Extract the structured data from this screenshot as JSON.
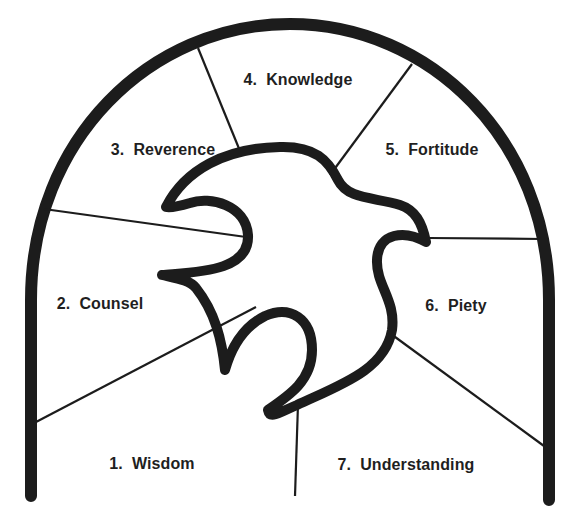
{
  "diagram": {
    "type": "arch-with-dove",
    "stroke_color": "#1c1c1c",
    "background": "#ffffff",
    "center_figure": "dove",
    "segments": [
      {
        "id": 1,
        "label": "1.  Wisdom",
        "x": 152,
        "y": 464
      },
      {
        "id": 2,
        "label": "2.  Counsel",
        "x": 100,
        "y": 304
      },
      {
        "id": 3,
        "label": "3.  Reverence",
        "x": 163,
        "y": 150
      },
      {
        "id": 4,
        "label": "4.  Knowledge",
        "x": 298,
        "y": 80
      },
      {
        "id": 5,
        "label": "5.  Fortitude",
        "x": 432,
        "y": 150
      },
      {
        "id": 6,
        "label": "6.  Piety",
        "x": 456,
        "y": 306
      },
      {
        "id": 7,
        "label": "7.  Understanding",
        "x": 406,
        "y": 465
      }
    ]
  }
}
